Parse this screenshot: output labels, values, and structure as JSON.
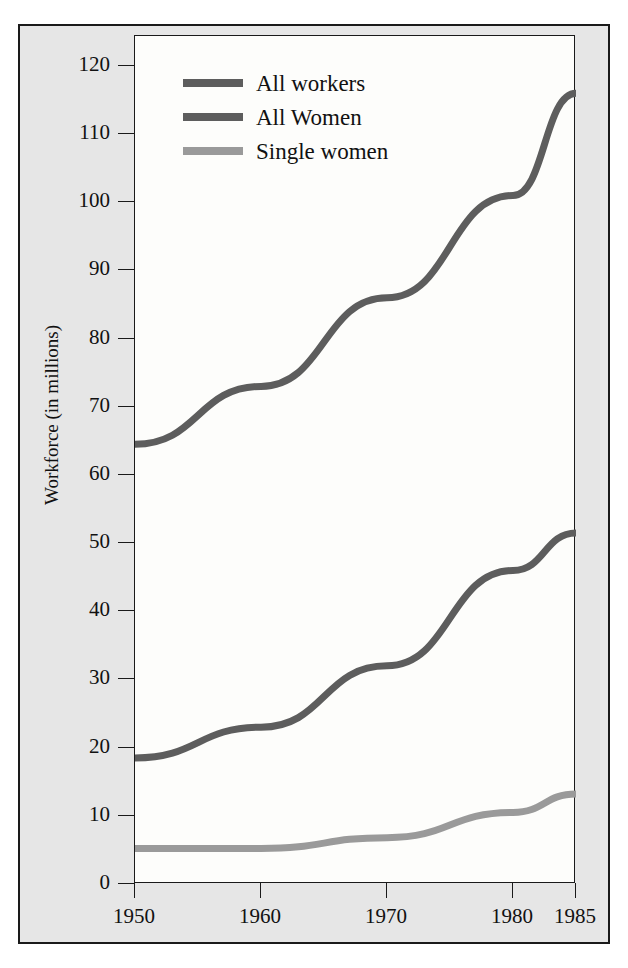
{
  "chart_data": {
    "type": "line",
    "title": "",
    "xlabel": "",
    "ylabel": "Workforce (in millions)",
    "x": [
      1950,
      1960,
      1970,
      1980,
      1985
    ],
    "xtick_labels": [
      "1950",
      "1960",
      "1970",
      "1980",
      "1985"
    ],
    "ytick_labels": [
      "0",
      "10",
      "20",
      "30",
      "40",
      "50",
      "60",
      "70",
      "80",
      "90",
      "100",
      "110",
      "120"
    ],
    "ytick_values": [
      0,
      10,
      20,
      30,
      40,
      50,
      60,
      70,
      80,
      90,
      100,
      110,
      120
    ],
    "ylim": [
      0,
      124
    ],
    "grid": false,
    "legend_position": "upper-left inside plot",
    "series": [
      {
        "name": "All workers",
        "color": "#5d5d5d",
        "values": [
          64.5,
          73.0,
          86.0,
          101.0,
          116.0
        ]
      },
      {
        "name": "All Women",
        "color": "#5d5d5d",
        "values": [
          18.5,
          23.0,
          32.0,
          46.0,
          51.5
        ]
      },
      {
        "name": "Single women",
        "color": "#9a9a9a",
        "values": [
          5.2,
          5.2,
          6.8,
          10.5,
          13.2
        ]
      }
    ]
  },
  "legend": {
    "items": [
      {
        "label": "All workers",
        "color": "#5d5d5d"
      },
      {
        "label": "All Women",
        "color": "#5d5d5d"
      },
      {
        "label": "Single women",
        "color": "#9a9a9a"
      }
    ]
  },
  "axes": {
    "y_title": "Workforce (in millions)"
  },
  "colors": {
    "panel_background": "#e6e6e6",
    "plot_background": "#fdfdfb",
    "frame": "#1a1a1a",
    "dark_line": "#5d5d5d",
    "light_line": "#9a9a9a",
    "text": "#111111"
  }
}
